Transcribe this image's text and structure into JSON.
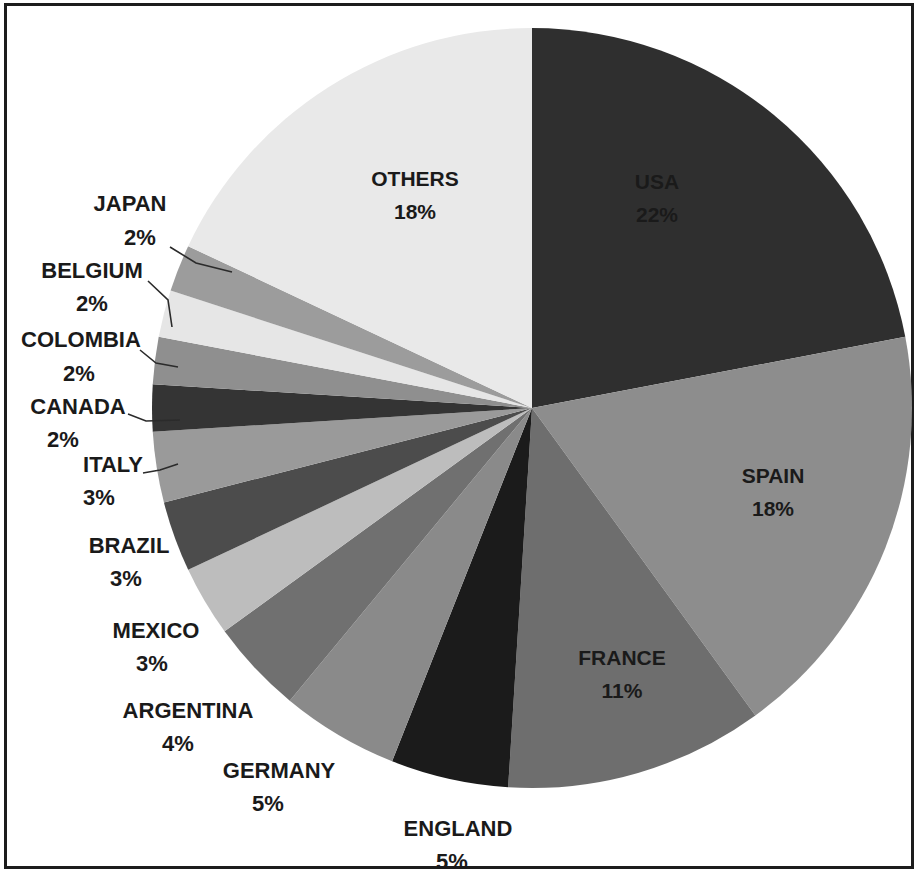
{
  "figure": {
    "border_color": "#1c1c1c",
    "background": "#ffffff"
  },
  "chart_data": {
    "type": "pie",
    "title": "",
    "subtitle": "",
    "legend_position": "none",
    "grid": false,
    "start_angle_deg": 0,
    "direction": "clockwise",
    "total_percent": 100,
    "categories": [
      "USA",
      "SPAIN",
      "FRANCE",
      "ENGLAND",
      "GERMANY",
      "ARGENTINA",
      "MEXICO",
      "BRAZIL",
      "ITALY",
      "CANADA",
      "COLOMBIA",
      "BELGIUM",
      "JAPAN",
      "OTHERS"
    ],
    "values": [
      22,
      18,
      11,
      5,
      5,
      4,
      3,
      3,
      3,
      2,
      2,
      2,
      2,
      18
    ],
    "labels": [
      "USA",
      "SPAIN",
      "FRANCE",
      "ENGLAND",
      "GERMANY",
      "ARGENTINA",
      "MEXICO",
      "BRAZIL",
      "ITALY",
      "CANADA",
      "COLOMBIA",
      "BELGIUM",
      "JAPAN",
      "OTHERS"
    ],
    "value_labels": [
      "22%",
      "18%",
      "11%",
      "5%",
      "5%",
      "4%",
      "3%",
      "3%",
      "3%",
      "2%",
      "2%",
      "2%",
      "2%",
      "18%"
    ],
    "colors": [
      "#2f2f2f",
      "#8d8d8d",
      "#6e6e6e",
      "#1b1b1b",
      "#8a8a8a",
      "#707070",
      "#bdbdbd",
      "#4c4c4c",
      "#9a9a9a",
      "#343434",
      "#8f8f8f",
      "#e6e6e6",
      "#9c9c9c",
      "#e9e9e9"
    ],
    "slices": [
      {
        "name": "USA",
        "percent": 22,
        "label": "USA",
        "value_label": "22%",
        "color": "#2f2f2f",
        "label_placement": "inside"
      },
      {
        "name": "SPAIN",
        "percent": 18,
        "label": "SPAIN",
        "value_label": "18%",
        "color": "#8d8d8d",
        "label_placement": "inside"
      },
      {
        "name": "FRANCE",
        "percent": 11,
        "label": "FRANCE",
        "value_label": "11%",
        "color": "#6e6e6e",
        "label_placement": "inside"
      },
      {
        "name": "ENGLAND",
        "percent": 5,
        "label": "ENGLAND",
        "value_label": "5%",
        "color": "#1b1b1b",
        "label_placement": "outside"
      },
      {
        "name": "GERMANY",
        "percent": 5,
        "label": "GERMANY",
        "value_label": "5%",
        "color": "#8a8a8a",
        "label_placement": "outside"
      },
      {
        "name": "ARGENTINA",
        "percent": 4,
        "label": "ARGENTINA",
        "value_label": "4%",
        "color": "#707070",
        "label_placement": "outside"
      },
      {
        "name": "MEXICO",
        "percent": 3,
        "label": "MEXICO",
        "value_label": "3%",
        "color": "#bdbdbd",
        "label_placement": "outside"
      },
      {
        "name": "BRAZIL",
        "percent": 3,
        "label": "BRAZIL",
        "value_label": "3%",
        "color": "#4c4c4c",
        "label_placement": "outside"
      },
      {
        "name": "ITALY",
        "percent": 3,
        "label": "ITALY",
        "value_label": "3%",
        "color": "#9a9a9a",
        "label_placement": "outside",
        "leader": true
      },
      {
        "name": "CANADA",
        "percent": 2,
        "label": "CANADA",
        "value_label": "2%",
        "color": "#343434",
        "label_placement": "outside",
        "leader": true
      },
      {
        "name": "COLOMBIA",
        "percent": 2,
        "label": "COLOMBIA",
        "value_label": "2%",
        "color": "#8f8f8f",
        "label_placement": "outside",
        "leader": true
      },
      {
        "name": "BELGIUM",
        "percent": 2,
        "label": "BELGIUM",
        "value_label": "2%",
        "color": "#e6e6e6",
        "label_placement": "outside",
        "leader": true
      },
      {
        "name": "JAPAN",
        "percent": 2,
        "label": "JAPAN",
        "value_label": "2%",
        "color": "#9c9c9c",
        "label_placement": "outside",
        "leader": true
      },
      {
        "name": "OTHERS",
        "percent": 18,
        "label": "OTHERS",
        "value_label": "18%",
        "color": "#e9e9e9",
        "label_placement": "inside"
      }
    ]
  },
  "geometry": {
    "center_x": 532,
    "center_y": 408,
    "radius": 380
  },
  "inside_labels": [
    {
      "name": "USA",
      "label": "USA",
      "value_label": "22%",
      "x": 657,
      "y": 183
    },
    {
      "name": "SPAIN",
      "label": "SPAIN",
      "value_label": "18%",
      "x": 773,
      "y": 477
    },
    {
      "name": "FRANCE",
      "label": "FRANCE",
      "value_label": "11%",
      "x": 622,
      "y": 659
    },
    {
      "name": "OTHERS",
      "label": "OTHERS",
      "value_label": "18%",
      "x": 415,
      "y": 180
    }
  ],
  "outside_labels": [
    {
      "name": "JAPAN",
      "label": "JAPAN",
      "value_label": "2%",
      "label_x": 130,
      "label_y": 205,
      "value_x": 140,
      "value_y": 239,
      "anchor": "middle"
    },
    {
      "name": "BELGIUM",
      "label": "BELGIUM",
      "value_label": "2%",
      "label_x": 92,
      "label_y": 272,
      "value_x": 92,
      "value_y": 305,
      "anchor": "middle"
    },
    {
      "name": "COLOMBIA",
      "label": "COLOMBIA",
      "value_label": "2%",
      "label_x": 81,
      "label_y": 341,
      "value_x": 79,
      "value_y": 375,
      "anchor": "middle"
    },
    {
      "name": "CANADA",
      "label": "CANADA",
      "value_label": "2%",
      "label_x": 78,
      "label_y": 408,
      "value_x": 63,
      "value_y": 441,
      "anchor": "middle"
    },
    {
      "name": "ITALY",
      "label": "ITALY",
      "value_label": "3%",
      "label_x": 113,
      "label_y": 466,
      "value_x": 99,
      "value_y": 499,
      "anchor": "middle"
    },
    {
      "name": "BRAZIL",
      "label": "BRAZIL",
      "value_label": "3%",
      "label_x": 129,
      "label_y": 547,
      "value_x": 126,
      "value_y": 580,
      "anchor": "middle"
    },
    {
      "name": "MEXICO",
      "label": "MEXICO",
      "value_label": "3%",
      "label_x": 156,
      "label_y": 632,
      "value_x": 152,
      "value_y": 665,
      "anchor": "middle"
    },
    {
      "name": "ARGENTINA",
      "label": "ARGENTINA",
      "value_label": "4%",
      "label_x": 188,
      "label_y": 712,
      "value_x": 178,
      "value_y": 745,
      "anchor": "middle"
    },
    {
      "name": "GERMANY",
      "label": "GERMANY",
      "value_label": "5%",
      "label_x": 279,
      "label_y": 772,
      "value_x": 268,
      "value_y": 805,
      "anchor": "middle"
    },
    {
      "name": "ENGLAND",
      "label": "ENGLAND",
      "value_label": "5%",
      "label_x": 458,
      "label_y": 830,
      "value_x": 452,
      "value_y": 863,
      "anchor": "middle"
    }
  ],
  "leaders": [
    {
      "name": "japan-leader",
      "points": "170,247 196,263 232,272"
    },
    {
      "name": "belgium-leader",
      "points": "148,281 168,300 172,327"
    },
    {
      "name": "colombia-leader",
      "points": "140,350 156,363 178,367"
    },
    {
      "name": "canada-leader",
      "points": "128,414 146,421 180,420"
    },
    {
      "name": "italy-leader",
      "points": "143,473 160,470 178,464"
    }
  ]
}
